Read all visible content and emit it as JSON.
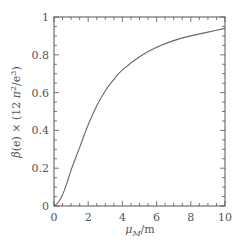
{
  "chart_data": {
    "type": "line",
    "title": "",
    "xlabel": "μ_M/m",
    "ylabel": "β(e) × (12 π²/e³)",
    "xlim": [
      0,
      10
    ],
    "ylim": [
      0,
      1
    ],
    "grid": false,
    "legend": null,
    "x_ticks": [
      "0",
      "2",
      "4",
      "6",
      "8",
      "10"
    ],
    "y_ticks": [
      "0",
      "0.2",
      "0.4",
      "0.6",
      "0.8",
      "1"
    ],
    "series": [
      {
        "name": "beta",
        "x": [
          0,
          0.25,
          0.5,
          0.75,
          1,
          1.5,
          2,
          2.5,
          3,
          3.5,
          4,
          5,
          6,
          7,
          8,
          9,
          10
        ],
        "values": [
          0,
          0.02,
          0.06,
          0.12,
          0.19,
          0.31,
          0.43,
          0.53,
          0.61,
          0.67,
          0.72,
          0.79,
          0.84,
          0.875,
          0.9,
          0.92,
          0.94
        ]
      }
    ]
  }
}
